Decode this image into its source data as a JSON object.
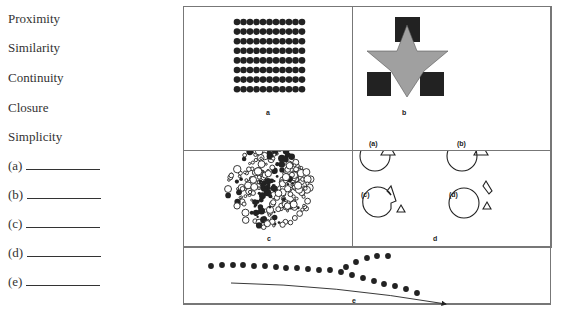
{
  "terms": [
    "Proximity",
    "Similarity",
    "Continuity",
    "Closure",
    "Simplicity"
  ],
  "blanks": [
    "(a)",
    "(b)",
    "(c)",
    "(d)",
    "(e)"
  ],
  "figures": {
    "a": {
      "caption": "a",
      "description": "grid of dots arranged 11 columns by 8 rows"
    },
    "b": {
      "caption": "b",
      "description": "gray six-pointed star over three black squares"
    },
    "c": {
      "caption": "c",
      "description": "circle of small open and filled dots forming a hidden figure"
    },
    "d": {
      "caption": "d",
      "sub_labels": [
        "(a)",
        "(b)",
        "(c)",
        "(d)"
      ],
      "description": "circles with triangles in various arrangements"
    },
    "e": {
      "caption": "e",
      "description": "two lines of dots diverging, with arrow along lower path"
    }
  }
}
